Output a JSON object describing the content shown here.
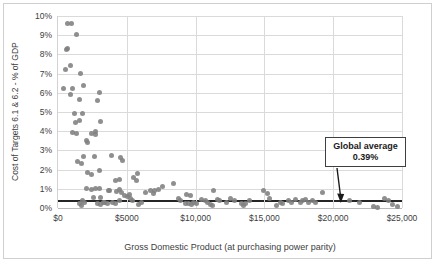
{
  "chart": {
    "y_axis_title": "Cost of Targets 6.1 & 6.2 - % of GDP",
    "x_axis_title": "Gross Domestic Product (at purchasing power parity)",
    "annotation_line1": "Global average",
    "annotation_line2": "0.39%"
  },
  "colors": {
    "marker": "#7f7f7f",
    "reference_line": "#252525",
    "gridline": "#dadada",
    "text": "#404040"
  },
  "chart_data": {
    "type": "scatter",
    "title": "",
    "xlabel": "Gross Domestic Product (at purchasing power parity)",
    "ylabel": "Cost of Targets 6.1 & 6.2 - % of GDP",
    "xlim": [
      0,
      25000
    ],
    "ylim": [
      0,
      10
    ],
    "x_ticks": [
      "$0",
      "$5000",
      "$10,000",
      "$15,000",
      "$20,000",
      "$25,000"
    ],
    "y_ticks": [
      "0%",
      "1%",
      "2%",
      "3%",
      "4%",
      "5%",
      "6%",
      "7%",
      "8%",
      "9%",
      "10%"
    ],
    "grid": true,
    "legend": "none",
    "reference_line": {
      "label": "Global average",
      "value_pct": 0.39
    },
    "annotation": {
      "text": "Global average 0.39%",
      "arrow_target_x": 19700,
      "arrow_target_pct": 0.39
    },
    "points_units": [
      "gdp_usd_ppp",
      "cost_percent_of_gdp"
    ],
    "points": [
      [
        660,
        9.6
      ],
      [
        950,
        9.6
      ],
      [
        1310,
        9.05
      ],
      [
        590,
        8.25
      ],
      [
        710,
        8.3
      ],
      [
        520,
        7.2
      ],
      [
        880,
        7.4
      ],
      [
        1630,
        7.0
      ],
      [
        420,
        6.2
      ],
      [
        1070,
        6.25
      ],
      [
        1860,
        6.4
      ],
      [
        3000,
        6.0
      ],
      [
        900,
        5.9
      ],
      [
        1550,
        5.65
      ],
      [
        2870,
        5.6
      ],
      [
        1190,
        4.9
      ],
      [
        1750,
        4.92
      ],
      [
        1240,
        4.45
      ],
      [
        1550,
        4.55
      ],
      [
        3120,
        4.5
      ],
      [
        1070,
        3.95
      ],
      [
        1310,
        3.88
      ],
      [
        2440,
        3.9
      ],
      [
        2690,
        3.97
      ],
      [
        2760,
        3.83
      ],
      [
        2040,
        3.53
      ],
      [
        2150,
        3.41
      ],
      [
        1860,
        2.66
      ],
      [
        2640,
        2.7
      ],
      [
        1430,
        2.4
      ],
      [
        1680,
        2.32
      ],
      [
        3880,
        2.75
      ],
      [
        4560,
        2.63
      ],
      [
        4680,
        2.49
      ],
      [
        2150,
        1.83
      ],
      [
        2400,
        1.76
      ],
      [
        3000,
        1.93
      ],
      [
        4200,
        1.45
      ],
      [
        4460,
        1.5
      ],
      [
        5520,
        1.59
      ],
      [
        5690,
        1.45
      ],
      [
        2400,
        0.96
      ],
      [
        2690,
        1.01
      ],
      [
        3720,
        0.92
      ],
      [
        2040,
        1.0
      ],
      [
        3000,
        1.04
      ],
      [
        2580,
        0.57
      ],
      [
        3120,
        0.54
      ],
      [
        4800,
        0.66
      ],
      [
        5040,
        0.61
      ],
      [
        5230,
        0.71
      ],
      [
        1790,
        0.4
      ],
      [
        1910,
        0.31
      ],
      [
        3360,
        0.31
      ],
      [
        3600,
        0.26
      ],
      [
        4440,
        0.4
      ],
      [
        5280,
        0.49
      ],
      [
        5450,
        0.4
      ],
      [
        3670,
        0.92
      ],
      [
        4270,
        0.87
      ],
      [
        4460,
        0.97
      ],
      [
        4650,
        0.83
      ],
      [
        2870,
        0.23
      ],
      [
        3120,
        0.18
      ],
      [
        3310,
        0.28
      ],
      [
        3950,
        0.31
      ],
      [
        4200,
        0.23
      ],
      [
        5880,
        0.18
      ],
      [
        6050,
        0.28
      ],
      [
        1550,
        0.23
      ],
      [
        1720,
        0.14
      ],
      [
        5760,
        1.79
      ],
      [
        6370,
        0.83
      ],
      [
        6720,
        0.92
      ],
      [
        6920,
        0.75
      ],
      [
        7010,
        0.89
      ],
      [
        7320,
        0.97
      ],
      [
        7630,
        1.1
      ],
      [
        8360,
        1.3
      ],
      [
        8770,
        0.49
      ],
      [
        8890,
        0.4
      ],
      [
        9370,
        0.71
      ],
      [
        9660,
        0.66
      ],
      [
        9250,
        0.26
      ],
      [
        9490,
        0.23
      ],
      [
        9730,
        0.19
      ],
      [
        9850,
        0.3
      ],
      [
        10090,
        0.23
      ],
      [
        10450,
        0.44
      ],
      [
        10690,
        0.37
      ],
      [
        10860,
        0.31
      ],
      [
        11290,
        0.92
      ],
      [
        11580,
        0.44
      ],
      [
        11770,
        0.37
      ],
      [
        11050,
        0.19
      ],
      [
        11240,
        0.14
      ],
      [
        12210,
        0.31
      ],
      [
        12540,
        0.49
      ],
      [
        12860,
        0.37
      ],
      [
        13340,
        0.23
      ],
      [
        13510,
        0.14
      ],
      [
        13650,
        0.26
      ],
      [
        13890,
        0.37
      ],
      [
        14950,
        0.89
      ],
      [
        15210,
        0.75
      ],
      [
        15380,
        0.49
      ],
      [
        15860,
        0.14
      ],
      [
        16150,
        0.31
      ],
      [
        16340,
        0.26
      ],
      [
        16770,
        0.4
      ],
      [
        16940,
        0.31
      ],
      [
        17260,
        0.44
      ],
      [
        17590,
        0.31
      ],
      [
        17780,
        0.37
      ],
      [
        18020,
        0.44
      ],
      [
        18220,
        0.31
      ],
      [
        18510,
        0.4
      ],
      [
        18700,
        0.31
      ],
      [
        19240,
        0.82
      ],
      [
        21200,
        0.37
      ],
      [
        21880,
        0.3
      ],
      [
        22960,
        0.07
      ],
      [
        23200,
        0.02
      ],
      [
        23760,
        0.47
      ],
      [
        24000,
        0.37
      ],
      [
        24290,
        0.19
      ],
      [
        24650,
        0.07
      ]
    ]
  }
}
